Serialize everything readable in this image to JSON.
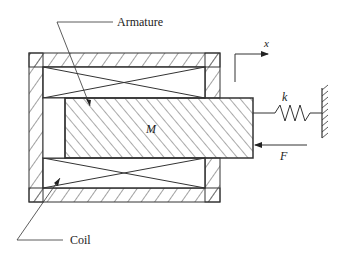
{
  "diagram": {
    "labels": {
      "armature": "Armature",
      "coil": "Coil",
      "mass": "M",
      "spring_constant": "k",
      "force": "F",
      "coordinate": "x"
    },
    "components": [
      {
        "id": "housing",
        "type": "hatched-frame"
      },
      {
        "id": "coil-top",
        "type": "coil-winding"
      },
      {
        "id": "coil-bottom",
        "type": "coil-winding"
      },
      {
        "id": "armature",
        "type": "hatched-block",
        "label": "M"
      },
      {
        "id": "spring",
        "type": "spring",
        "label": "k"
      },
      {
        "id": "ground-wall",
        "type": "fixed-support"
      },
      {
        "id": "force-arrow",
        "type": "arrow",
        "direction": "left",
        "label": "F"
      },
      {
        "id": "x-axis",
        "type": "coordinate-arrow",
        "direction": "right",
        "label": "x"
      }
    ],
    "colors": {
      "line": "#333333",
      "background": "#ffffff"
    }
  }
}
